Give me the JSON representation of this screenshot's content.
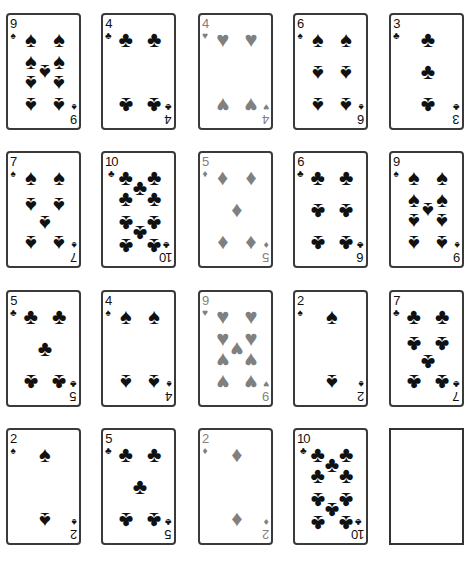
{
  "colors": {
    "black_suit": "#111111",
    "red_suit": "#808080",
    "card_border": "#3a3a3a"
  },
  "suit_glyphs": {
    "spades": "♠",
    "clubs": "♣",
    "hearts": "♥",
    "diamonds": "♦"
  },
  "tableau": {
    "rows": [
      [
        {
          "rank": "9",
          "suit": "spades",
          "color": "black"
        },
        {
          "rank": "4",
          "suit": "clubs",
          "color": "black"
        },
        {
          "rank": "4",
          "suit": "hearts",
          "color": "red"
        },
        {
          "rank": "6",
          "suit": "spades",
          "color": "black"
        },
        {
          "rank": "3",
          "suit": "clubs",
          "color": "black"
        }
      ],
      [
        {
          "rank": "7",
          "suit": "spades",
          "color": "black"
        },
        {
          "rank": "10",
          "suit": "clubs",
          "color": "black"
        },
        {
          "rank": "5",
          "suit": "diamonds",
          "color": "red"
        },
        {
          "rank": "6",
          "suit": "clubs",
          "color": "black"
        },
        {
          "rank": "9",
          "suit": "spades",
          "color": "black"
        }
      ],
      [
        {
          "rank": "5",
          "suit": "clubs",
          "color": "black"
        },
        {
          "rank": "4",
          "suit": "spades",
          "color": "black"
        },
        {
          "rank": "9",
          "suit": "hearts",
          "color": "red"
        },
        {
          "rank": "2",
          "suit": "spades",
          "color": "black"
        },
        {
          "rank": "7",
          "suit": "clubs",
          "color": "black"
        }
      ],
      [
        {
          "rank": "2",
          "suit": "spades",
          "color": "black"
        },
        {
          "rank": "5",
          "suit": "clubs",
          "color": "black"
        },
        {
          "rank": "2",
          "suit": "diamonds",
          "color": "red"
        },
        {
          "rank": "10",
          "suit": "clubs",
          "color": "black"
        },
        {
          "empty": true
        }
      ]
    ]
  }
}
